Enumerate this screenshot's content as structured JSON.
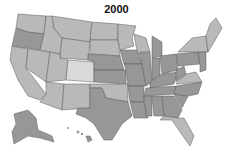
{
  "title": "2000",
  "legend_shades": {
    "light": "#d9d9d9",
    "medium": "#b9b9b9",
    "dark": "#979797"
  },
  "states": [
    {
      "abbr": "WA",
      "shade": "medium"
    },
    {
      "abbr": "OR",
      "shade": "dark"
    },
    {
      "abbr": "CA",
      "shade": "medium"
    },
    {
      "abbr": "ID",
      "shade": "medium"
    },
    {
      "abbr": "NV",
      "shade": "medium"
    },
    {
      "abbr": "MT",
      "shade": "medium"
    },
    {
      "abbr": "WY",
      "shade": "medium"
    },
    {
      "abbr": "UT",
      "shade": "medium"
    },
    {
      "abbr": "CO",
      "shade": "light"
    },
    {
      "abbr": "AZ",
      "shade": "medium"
    },
    {
      "abbr": "NM",
      "shade": "medium"
    },
    {
      "abbr": "ND",
      "shade": "medium"
    },
    {
      "abbr": "SD",
      "shade": "medium"
    },
    {
      "abbr": "NE",
      "shade": "dark"
    },
    {
      "abbr": "KS",
      "shade": "dark"
    },
    {
      "abbr": "OK",
      "shade": "medium"
    },
    {
      "abbr": "TX",
      "shade": "dark"
    },
    {
      "abbr": "MN",
      "shade": "medium"
    },
    {
      "abbr": "IA",
      "shade": "dark"
    },
    {
      "abbr": "MO",
      "shade": "dark"
    },
    {
      "abbr": "AR",
      "shade": "dark"
    },
    {
      "abbr": "LA",
      "shade": "dark"
    },
    {
      "abbr": "WI",
      "shade": "medium"
    },
    {
      "abbr": "IL",
      "shade": "dark"
    },
    {
      "abbr": "MI",
      "shade": "dark"
    },
    {
      "abbr": "IN",
      "shade": "dark"
    },
    {
      "abbr": "OH",
      "shade": "dark"
    },
    {
      "abbr": "KY",
      "shade": "dark"
    },
    {
      "abbr": "TN",
      "shade": "dark"
    },
    {
      "abbr": "MS",
      "shade": "dark"
    },
    {
      "abbr": "AL",
      "shade": "dark"
    },
    {
      "abbr": "GA",
      "shade": "dark"
    },
    {
      "abbr": "FL",
      "shade": "medium"
    },
    {
      "abbr": "SC",
      "shade": "dark"
    },
    {
      "abbr": "NC",
      "shade": "dark"
    },
    {
      "abbr": "VA",
      "shade": "medium"
    },
    {
      "abbr": "WV",
      "shade": "dark"
    },
    {
      "abbr": "PA",
      "shade": "dark"
    },
    {
      "abbr": "NY",
      "shade": "medium"
    },
    {
      "abbr": "ME",
      "shade": "medium"
    },
    {
      "abbr": "NE-states",
      "shade": "medium"
    },
    {
      "abbr": "AK",
      "shade": "dark"
    },
    {
      "abbr": "HI",
      "shade": "dark"
    }
  ]
}
